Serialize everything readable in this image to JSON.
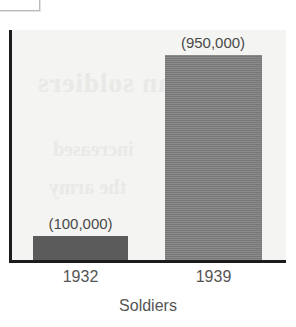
{
  "figure": {
    "xlabel": "Soldiers",
    "artifacts": {
      "corner_box": "",
      "ghost_text_1": "German soldiers",
      "ghost_text_2": "increased",
      "ghost_text_3": "the army"
    }
  },
  "chart_data": {
    "type": "bar",
    "title": "",
    "xlabel": "Soldiers",
    "ylabel": "",
    "categories": [
      "1932",
      "1939"
    ],
    "values": [
      100000,
      950000
    ],
    "value_labels": [
      "(100,000)",
      "(950,000)"
    ],
    "ylim": [
      0,
      1070000
    ],
    "grid": false,
    "legend": false,
    "bar_colors": [
      "#5b5b5b",
      "#7e7e7e"
    ],
    "background_color": "#f4f4f2",
    "axis_color": "#1c1c1c"
  }
}
